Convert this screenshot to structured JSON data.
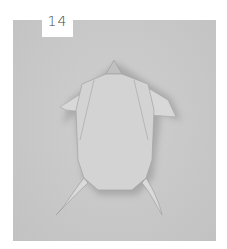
{
  "step": {
    "number": "14"
  },
  "photo": {
    "subject": "origami-turtle-model",
    "background_color": "#c9c9c9",
    "paper_color": "#d4d4d4"
  }
}
